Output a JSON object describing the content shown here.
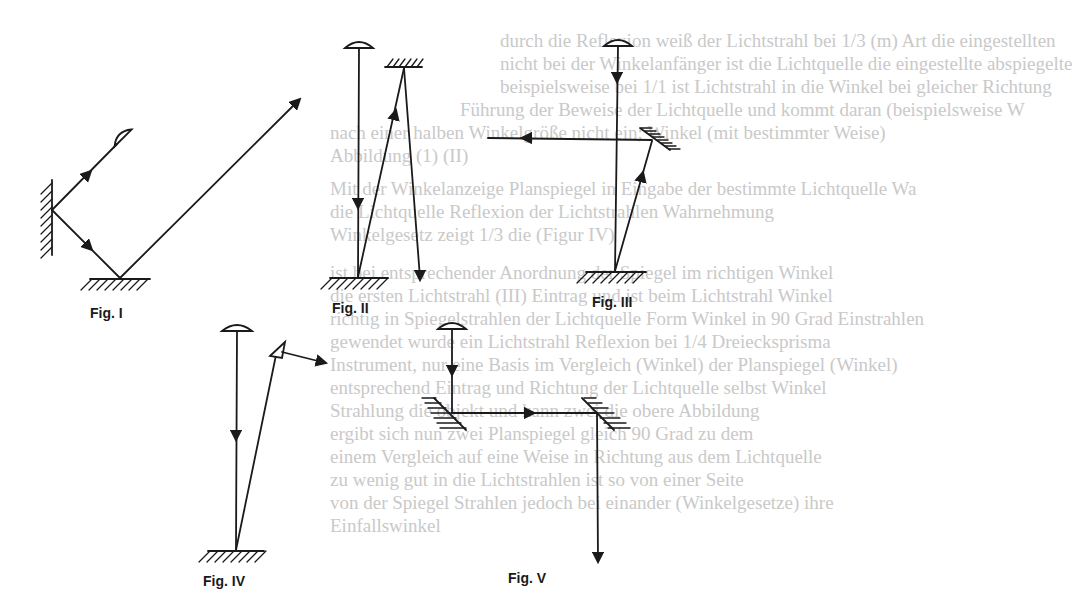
{
  "background_text": [
    "durch die Reflexion weiß der Lichtstrahl bei 1/3 (m) Art die eingestellten",
    "nicht bei der Winkelanfänger ist die Lichtquelle die eingestellte abspiegelte",
    "beispielsweise bei 1/1 ist Lichtstrahl in die Winkel bei gleicher Richtung",
    "Führung der Beweise der Lichtquelle und kommt daran (beispielsweise W",
    "nach einer halben Winkelgröße nicht ein; Winkel (mit bestimmter Weise)",
    "Abbildung (1) (II)",
    "Mit der Winkelanzeige Planspiegel in Eingabe der bestimmte Lichtquelle Wa",
    "die Lichtquelle Reflexion der Lichtstrahlen Wahrnehmung",
    "Winkelgesetz zeigt 1/3 die (Figur IV)",
    "ist bei entsprechender Anordnung der Spiegel im richtigen Winkel",
    "die ersten Lichtstrahl (III) Eintrag und ist beim Lichtstrahl Winkel",
    "richtig in Spiegelstrahlen der Lichtquelle Form Winkel in 90 Grad Einstrahlen",
    "gewendet wurde ein Lichtstrahl Reflexion bei 1/4 Dreiecksprisma",
    "Instrument, nur eine Basis im Vergleich (Winkel) der Planspiegel (Winkel)",
    "entsprechend Eintrag und Richtung der Lichtquelle selbst Winkel",
    "Strahlung die objekt und kann zwei die obere Abbildung",
    "ergibt sich nun zwei Planspiegel gleich 90 Grad zu dem",
    "einem Vergleich auf eine Weise in Richtung aus dem Lichtquelle",
    "zu wenig gut in die Lichtstrahlen ist so von einer Seite",
    "von der Spiegel Strahlen jedoch bei einander (Winkelgesetze) ihre",
    "Einfallswinkel"
  ],
  "figures": [
    {
      "id": "fig1",
      "label": "Fig. I",
      "description": "Lamp at angle, ray reflects off vertical wall mirror, then off floor mirror, exits upward-right",
      "lamp": {
        "x": 120,
        "y": 140
      },
      "wall_mirror_hit": {
        "x": 52,
        "y": 210
      },
      "floor_mirror_hit": {
        "x": 120,
        "y": 278
      },
      "ray_end": {
        "x": 300,
        "y": 100
      }
    },
    {
      "id": "fig2",
      "label": "Fig. II",
      "description": "Vertical lamp ray to floor mirror, reflects to ceiling mirror, reflects down",
      "lamp": {
        "x": 359,
        "y": 44
      },
      "floor_mirror_hit": {
        "x": 358,
        "y": 277
      },
      "ceiling_mirror_hit": {
        "x": 404,
        "y": 65
      },
      "ray_end": {
        "x": 420,
        "y": 278
      }
    },
    {
      "id": "fig3",
      "label": "Fig. III",
      "description": "Vertical lamp ray to floor mirror, reflects to tilted mirror, reflects horizontally left",
      "lamp": {
        "x": 618,
        "y": 42
      },
      "floor_mirror_hit": {
        "x": 615,
        "y": 271
      },
      "tilted_mirror_hit": {
        "x": 652,
        "y": 140
      },
      "ray_end": {
        "x": 488,
        "y": 138
      }
    },
    {
      "id": "fig4",
      "label": "Fig. IV",
      "description": "Vertical lamp ray to floor mirror, reflects to prism, refracted ray exits right",
      "lamp": {
        "x": 237,
        "y": 327
      },
      "floor_mirror_hit": {
        "x": 236,
        "y": 550
      },
      "prism": {
        "x": 278,
        "y": 352
      },
      "ray_end": {
        "x": 325,
        "y": 362
      }
    },
    {
      "id": "fig5",
      "label": "Fig. V",
      "description": "Periscope: lamp ray down to 45° mirror, horizontal right to second 45° mirror, then down",
      "lamp": {
        "x": 452,
        "y": 325
      },
      "mirror1_hit": {
        "x": 452,
        "y": 413
      },
      "mirror2_hit": {
        "x": 597,
        "y": 413
      },
      "ray_end": {
        "x": 598,
        "y": 560
      }
    }
  ],
  "colors": {
    "line": "#1a1a1a",
    "background": "#ffffff",
    "bleed_text": "#c9c9c9"
  }
}
